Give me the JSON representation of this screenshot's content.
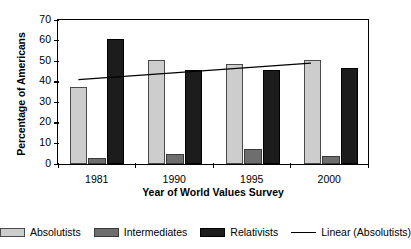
{
  "chart_data": {
    "type": "bar",
    "title": "",
    "xlabel": "Year of World Values Survey",
    "ylabel": "Percentage of Americans",
    "categories": [
      "1981",
      "1990",
      "1995",
      "2000"
    ],
    "ylim": [
      0,
      70
    ],
    "yticks": [
      0,
      10,
      20,
      30,
      40,
      50,
      60,
      70
    ],
    "grid": false,
    "legend_position": "bottom",
    "series": [
      {
        "name": "Absolutists",
        "values": [
          37,
          50,
          48,
          50
        ],
        "color": "#cdcdcd"
      },
      {
        "name": "Intermediates",
        "values": [
          3,
          5,
          7,
          4
        ],
        "color": "#6e6e6e"
      },
      {
        "name": "Relativists",
        "values": [
          60,
          45,
          45,
          46
        ],
        "color": "#1c1c1c"
      }
    ],
    "trendline": {
      "name": "Linear (Absolutists)",
      "color": "#000000",
      "start_value": 41,
      "end_value": 49
    }
  },
  "legend": {
    "entries": [
      {
        "label": "Absolutists"
      },
      {
        "label": "Intermediates"
      },
      {
        "label": "Relativists"
      },
      {
        "label": "Linear (Absolutists)"
      }
    ]
  }
}
